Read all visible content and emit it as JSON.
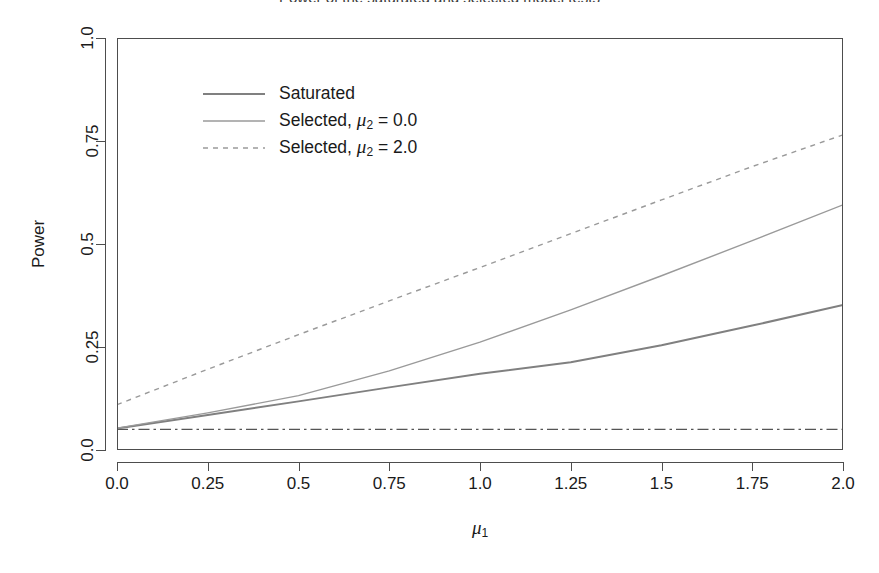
{
  "chart_data": {
    "type": "line",
    "title": "Power of the saturated and selected model tests",
    "xlabel": "μ₁",
    "ylabel": "Power",
    "x": [
      0.0,
      0.25,
      0.5,
      0.75,
      1.0,
      1.25,
      1.5,
      1.75,
      2.0
    ],
    "xlim": [
      0.0,
      2.0
    ],
    "ylim": [
      0.0,
      1.0
    ],
    "xticks": [
      "0.0",
      "0.25",
      "0.5",
      "0.75",
      "1.0",
      "1.25",
      "1.5",
      "1.75",
      "2.0"
    ],
    "xtick_values": [
      0.0,
      0.25,
      0.5,
      0.75,
      1.0,
      1.25,
      1.5,
      1.75,
      2.0
    ],
    "yticks": [
      "0.0",
      "0.25",
      "0.5",
      "0.75",
      "1.0"
    ],
    "ytick_values": [
      0.0,
      0.25,
      0.5,
      0.75,
      1.0
    ],
    "grid": false,
    "legend_position": "top-left",
    "series": [
      {
        "name": "Saturated",
        "style": "solid",
        "color": "#808080",
        "width": 2.0,
        "values": [
          0.052,
          0.085,
          0.118,
          0.152,
          0.185,
          0.213,
          0.254,
          0.302,
          0.352
        ]
      },
      {
        "name": "Selected, μ₂ = 0.0",
        "style": "solid",
        "color": "#9a9a9a",
        "width": 1.4,
        "values": [
          0.053,
          0.09,
          0.132,
          0.192,
          0.262,
          0.34,
          0.423,
          0.508,
          0.595
        ]
      },
      {
        "name": "Selected, μ₂ = 2.0",
        "style": "dashed",
        "color": "#9a9a9a",
        "width": 1.4,
        "values": [
          0.11,
          0.196,
          0.28,
          0.362,
          0.443,
          0.525,
          0.607,
          0.688,
          0.765
        ]
      },
      {
        "name": "nominal level",
        "style": "dashdot",
        "color": "#555555",
        "width": 1.4,
        "values": [
          0.05,
          0.05,
          0.05,
          0.05,
          0.05,
          0.05,
          0.05,
          0.05,
          0.05
        ]
      }
    ],
    "legend": [
      {
        "label_prefix": "Saturated",
        "mu_sub": "",
        "mu_value": "",
        "style": "solid"
      },
      {
        "label_prefix": "Selected,",
        "mu_sub": "2",
        "mu_value": "= 0.0",
        "style": "solid"
      },
      {
        "label_prefix": "Selected,",
        "mu_sub": "2",
        "mu_value": "= 2.0",
        "style": "dashed"
      }
    ],
    "annotations": [
      {
        "name": "nominal-level-line",
        "text": "",
        "y": 0.05
      }
    ]
  },
  "axis": {
    "y_title": "Power",
    "x_title_base": "μ",
    "x_title_sub": "1"
  }
}
